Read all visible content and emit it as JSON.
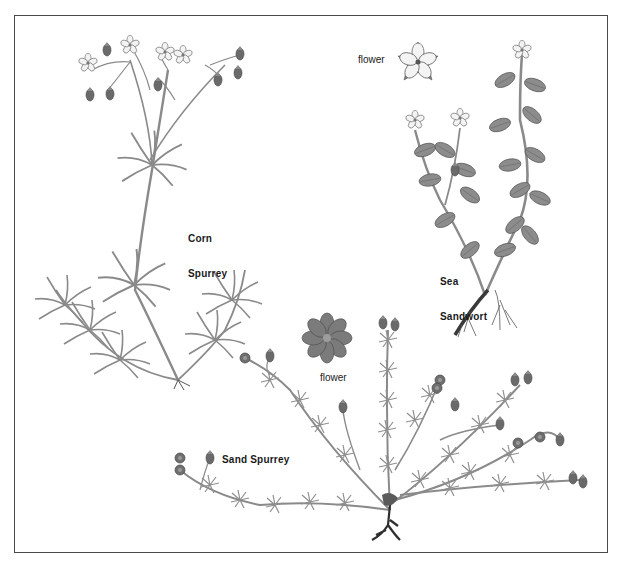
{
  "plants": [
    {
      "id": "corn-spurrey",
      "label_line1": "Corn",
      "label_line2": "Spurrey"
    },
    {
      "id": "sea-sandwort",
      "label_line1": "Sea",
      "label_line2": "Sandwort",
      "flower_caption": "flower"
    },
    {
      "id": "sand-spurrey",
      "label_line1": "Sand Spurrey",
      "flower_caption": "flower"
    }
  ],
  "colors": {
    "frame": "#4a4a4a",
    "stem": "#8a8a8a",
    "leaf_dark": "#6f6f6f",
    "leaf_light": "#b5b5b5",
    "petal": "#f2f2f2",
    "root": "#3a3a3a"
  }
}
